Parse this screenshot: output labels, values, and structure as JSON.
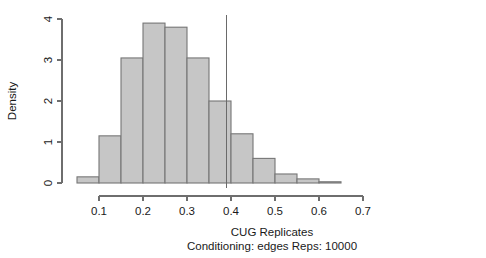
{
  "chart_data": {
    "type": "bar",
    "subtype": "histogram",
    "title": "",
    "xlabel": "CUG Replicates",
    "sublabel": "Conditioning: edges Reps: 10000",
    "ylabel": "Density",
    "xlim": [
      0.025,
      0.7
    ],
    "ylim": [
      0,
      4.05
    ],
    "xticks": [
      0.1,
      0.2,
      0.3,
      0.4,
      0.5,
      0.6,
      0.7
    ],
    "xtick_labels": [
      "0.1",
      "0.2",
      "0.3",
      "0.4",
      "0.5",
      "0.6",
      "0.7"
    ],
    "yticks": [
      0,
      1,
      2,
      3,
      4
    ],
    "ytick_labels": [
      "0",
      "1",
      "2",
      "3",
      "4"
    ],
    "grid": false,
    "legend": false,
    "bin_width": 0.05,
    "bin_edges": [
      0.05,
      0.1,
      0.15,
      0.2,
      0.25,
      0.3,
      0.35,
      0.4,
      0.45,
      0.5,
      0.55,
      0.6,
      0.65
    ],
    "categories": [
      "0.05-0.10",
      "0.10-0.15",
      "0.15-0.20",
      "0.20-0.25",
      "0.25-0.30",
      "0.30-0.35",
      "0.35-0.40",
      "0.40-0.45",
      "0.45-0.50",
      "0.50-0.55",
      "0.55-0.60",
      "0.60-0.65"
    ],
    "values": [
      0.15,
      1.15,
      3.05,
      3.9,
      3.8,
      3.05,
      2.0,
      1.2,
      0.6,
      0.22,
      0.1,
      0.03
    ],
    "annotations": [
      {
        "name": "observed-value-line",
        "type": "vline",
        "x": 0.39,
        "label": ""
      }
    ]
  },
  "axis_style": {
    "bar_fill": "#c6c6c6",
    "bar_stroke": "#767676",
    "axis_color": "#6e6e6e",
    "text_color": "#1a1a1a",
    "background": "#ffffff"
  }
}
